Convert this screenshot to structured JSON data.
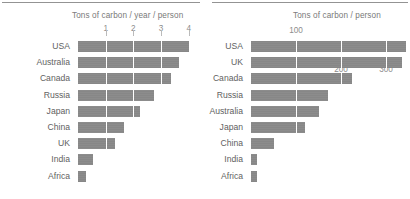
{
  "figure": {
    "background": "#ffffff",
    "bar_color": "#878787",
    "text_color": "#6f6f6f"
  },
  "panels": [
    {
      "id": "left",
      "axis_title": "Tons of carbon / year / person"
    },
    {
      "id": "right",
      "axis_title": "Tons of carbon / person"
    }
  ],
  "chart_data": [
    {
      "type": "bar",
      "orientation": "horizontal",
      "title": "Tons of carbon / year / person",
      "xlabel": "Tons of carbon / year / person",
      "ylabel": "",
      "xlim": [
        0,
        4.3
      ],
      "xticks": [
        1,
        2,
        3,
        4
      ],
      "xtick_labels": [
        "1",
        "2",
        "3",
        "4"
      ],
      "grid": false,
      "legend": "none",
      "categories": [
        "USA",
        "Australia",
        "Canada",
        "Russia",
        "Japan",
        "China",
        "UK",
        "India",
        "Africa"
      ],
      "values": [
        4.0,
        3.65,
        3.35,
        2.75,
        2.25,
        1.65,
        1.35,
        0.55,
        0.3
      ]
    },
    {
      "type": "bar",
      "orientation": "horizontal",
      "title": "Tons of carbon / person",
      "xlabel": "Tons of carbon / person",
      "ylabel": "",
      "xlim": [
        0,
        355
      ],
      "xticks": [
        100,
        200,
        300
      ],
      "xtick_labels": [
        "100",
        "200",
        "300"
      ],
      "grid": false,
      "legend": "none",
      "categories": [
        "USA",
        "UK",
        "Canada",
        "Russia",
        "Australia",
        "Japan",
        "China",
        "India",
        "Africa"
      ],
      "values": [
        345,
        335,
        225,
        170,
        150,
        120,
        50,
        13,
        13
      ]
    }
  ]
}
